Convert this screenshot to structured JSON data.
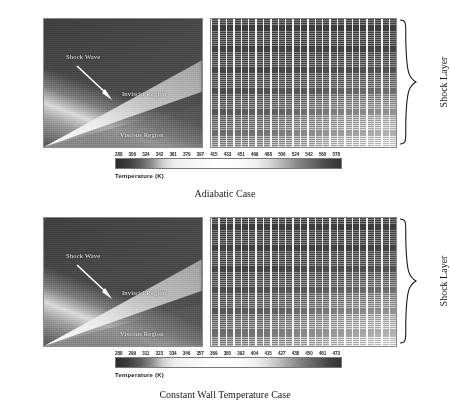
{
  "figure": {
    "panels": [
      {
        "id": "adiabatic",
        "caption": "Adiabatic Case",
        "contour": {
          "annotations": {
            "shock_wave": "Shock Wave",
            "inviscid_region": "Inviscid Region",
            "viscous_region": "Viscous Region"
          }
        },
        "grid": {
          "brace_label": "Shock Layer"
        },
        "colorbar": {
          "title": "Temperature  (K)",
          "ticks": [
            288,
            306,
            324,
            342,
            361,
            379,
            397,
            415,
            433,
            451,
            469,
            488,
            506,
            524,
            542,
            560,
            578
          ]
        }
      },
      {
        "id": "constant-wall-temperature",
        "caption": "Constant Wall Temperature Case",
        "contour": {
          "annotations": {
            "shock_wave": "Shock Wave",
            "inviscid_region": "Inviscid Region",
            "viscous_region": "Viscous Region"
          }
        },
        "grid": {
          "brace_label": "Shock Layer"
        },
        "colorbar": {
          "title": "Temperature  (K)",
          "ticks": [
            288,
            299,
            311,
            323,
            334,
            346,
            357,
            369,
            380,
            392,
            404,
            415,
            427,
            438,
            450,
            461,
            473
          ]
        }
      }
    ]
  },
  "chart_data": {
    "type": "heatmap",
    "panels": [
      {
        "name": "Adiabatic Case",
        "left_view": "temperature contour",
        "right_view": "computational grid with temperature shading",
        "colorbar_label": "Temperature  (K)",
        "colorbar_ticks": [
          288,
          306,
          324,
          342,
          361,
          379,
          397,
          415,
          433,
          451,
          469,
          488,
          506,
          524,
          542,
          560,
          578
        ],
        "tick_step": 18.1,
        "vmin": 288,
        "vmax": 578,
        "colormap": "grayscale-cyclic",
        "annotations": [
          "Shock Wave",
          "Inviscid Region",
          "Viscous Region",
          "Shock Layer"
        ]
      },
      {
        "name": "Constant Wall Temperature Case",
        "left_view": "temperature contour",
        "right_view": "computational grid with temperature shading",
        "colorbar_label": "Temperature  (K)",
        "colorbar_ticks": [
          288,
          299,
          311,
          323,
          334,
          346,
          357,
          369,
          380,
          392,
          404,
          415,
          427,
          438,
          450,
          461,
          473
        ],
        "tick_step": 11.56,
        "vmin": 288,
        "vmax": 473,
        "colormap": "grayscale-cyclic",
        "annotations": [
          "Shock Wave",
          "Inviscid Region",
          "Viscous Region",
          "Shock Layer"
        ]
      }
    ],
    "xlabel": "",
    "ylabel": "",
    "legend_position": "below-plot"
  }
}
